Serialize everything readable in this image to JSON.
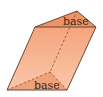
{
  "diagram": {
    "type": "oblique-triangular-prism",
    "labels": {
      "top_base": "base",
      "bottom_base": "base"
    },
    "colors": {
      "base_face": "#ec9468",
      "side_face": "#f6b08c",
      "side_face_light": "#fac3a5",
      "edge": "#5a3a2a",
      "hidden_edge": "#6b4330"
    }
  }
}
